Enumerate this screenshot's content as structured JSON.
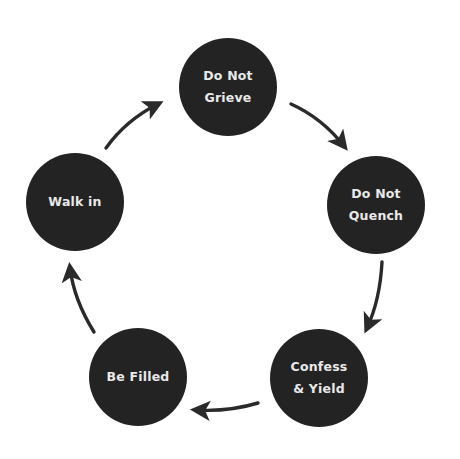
{
  "diagram": {
    "type": "cycle",
    "direction": "clockwise",
    "colors": {
      "background": "#ffffff",
      "node_fill": "#232323",
      "node_text": "#e9e9e9",
      "arrow": "#2a2a2a"
    },
    "nodes": [
      {
        "id": "grieve",
        "label": "Do Not\nGrieve"
      },
      {
        "id": "quench",
        "label": "Do Not\nQuench"
      },
      {
        "id": "confess",
        "label": "Confess\n& Yield"
      },
      {
        "id": "filled",
        "label": "Be Filled"
      },
      {
        "id": "walk",
        "label": "Walk in"
      }
    ],
    "edges": [
      {
        "from": "grieve",
        "to": "quench"
      },
      {
        "from": "quench",
        "to": "confess"
      },
      {
        "from": "confess",
        "to": "filled"
      },
      {
        "from": "filled",
        "to": "walk"
      },
      {
        "from": "walk",
        "to": "grieve"
      }
    ]
  }
}
